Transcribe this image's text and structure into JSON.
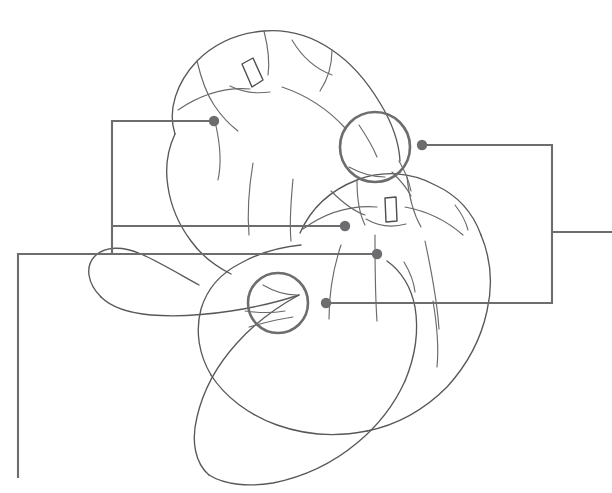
{
  "figure": {
    "background_color": "#ffffff",
    "ink_color": "#58585a",
    "callout_color": "#6d6d6f",
    "width": 612,
    "height": 493
  },
  "subjects": [
    {
      "id": "pumpkin-upper-left",
      "label": "Upper left pumpkin",
      "stalk": {
        "label": "Stalk",
        "x": 250,
        "y": 72,
        "angle": -28
      }
    },
    {
      "id": "pumpkin-lower-right",
      "label": "Lower right pumpkin",
      "stalk": {
        "label": "Stalk",
        "x": 390,
        "y": 209,
        "angle": 4
      }
    }
  ],
  "highlight_circles": [
    {
      "id": "highlight-circle-upper",
      "label": "Detail highlight upper",
      "cx": 375,
      "cy": 147,
      "r": 35
    },
    {
      "id": "highlight-circle-lower",
      "label": "Detail highlight lower",
      "cx": 278,
      "cy": 303,
      "r": 30
    }
  ],
  "callouts": [
    {
      "id": "callout-1",
      "label": "Callout 1 leader",
      "dot": {
        "x": 214,
        "y": 121
      },
      "path": "M 214 121 L 112 121 L 112 254"
    },
    {
      "id": "callout-2",
      "label": "Callout 2 leader",
      "dot": {
        "x": 345,
        "y": 226
      },
      "path": "M 345 226 L 112 226"
    },
    {
      "id": "callout-3",
      "label": "Callout 3 leader",
      "dot": {
        "x": 377,
        "y": 254
      },
      "path": "M 377 254 L 18 254 L 18 478"
    },
    {
      "id": "callout-4",
      "label": "Callout 4 leader",
      "dot": {
        "x": 422,
        "y": 145
      },
      "path": "M 422 145 L 552 145 L 552 232 L 612 232"
    },
    {
      "id": "callout-5",
      "label": "Callout 5 leader",
      "dot": {
        "x": 326,
        "y": 303
      },
      "path": "M 326 303 L 552 303 L 552 232"
    }
  ],
  "sketch_strokes": {
    "pumpkin_upper_outline": "M 175 132 C 168 110 176 82 196 62 C 214 44 238 34 262 32 C 288 30 312 38 330 50 C 352 64 366 82 378 102 C 390 120 398 140 398 160",
    "pumpkin_upper_outline_left": "M 175 132 C 168 148 166 166 168 184 C 170 204 178 222 190 238 C 200 252 214 264 230 272",
    "pumpkin_upper_rib_1": "M 196 62 C 200 78 204 92 212 104 C 220 116 228 124 236 130",
    "pumpkin_upper_rib_2": "M 262 32 C 266 48 268 62 266 74",
    "pumpkin_upper_rib_3": "M 290 40 C 300 56 314 68 330 74",
    "pumpkin_upper_rib_4": "M 330 50 C 330 64 326 78 318 90",
    "pumpkin_upper_crease_left": "M 176 108 C 198 94 222 86 248 88",
    "pumpkin_upper_crease_right": "M 280 86 C 304 94 326 108 344 128",
    "pumpkin_upper_inner_1": "M 214 124 C 218 142 220 160 216 178",
    "pumpkin_upper_inner_2": "M 252 162 C 248 186 246 210 248 234",
    "pumpkin_upper_inner_3": "M 292 178 C 290 200 288 220 290 240",
    "pumpkin_lower_outline_top": "M 300 232 C 310 208 330 190 356 180 C 382 170 410 172 434 184 C 456 194 472 212 480 234",
    "pumpkin_lower_outline_right": "M 480 234 C 490 258 492 284 486 310 C 480 338 466 364 446 386 C 424 408 396 424 366 430",
    "pumpkin_lower_outline_bottom": "M 366 430 C 336 436 304 434 276 424 C 248 414 224 396 210 374",
    "pumpkin_lower_outline_left": "M 210 374 C 198 354 194 330 200 308 C 206 288 220 272 240 262 C 258 252 280 246 300 244",
    "pumpkin_lower_rib_1": "M 356 180 C 356 198 358 212 364 224",
    "pumpkin_lower_rib_2": "M 406 176 C 408 196 412 212 420 226",
    "pumpkin_lower_crease_left": "M 302 228 C 324 212 350 204 376 206",
    "pumpkin_lower_crease_right": "M 404 206 C 426 210 446 220 462 234",
    "pumpkin_lower_inner_1": "M 374 234 C 374 262 374 292 376 320",
    "pumpkin_lower_inner_2": "M 424 240 C 430 268 436 298 438 328",
    "pumpkin_lower_inner_3": "M 340 244 C 332 268 328 294 328 318",
    "pumpkin_lower_inner_4": "M 432 300 C 436 324 438 346 436 366",
    "gourd_lobe_left": "M 100 296 C 86 282 84 266 94 256 C 104 246 122 246 140 254 C 158 262 178 274 198 284",
    "gourd_lobe_left_b": "M 100 296 C 110 306 128 312 150 314 C 176 316 204 314 230 310 C 256 306 280 300 298 294",
    "gourd_tail": "M 298 294 C 276 306 254 322 236 342 C 216 364 202 390 196 416 C 190 440 194 462 208 474",
    "gourd_tail_b": "M 208 474 C 224 484 248 486 272 482 C 302 476 332 462 356 442 C 378 424 394 402 404 380",
    "gourd_tail_c": "M 404 380 C 414 356 418 330 414 306 C 410 286 400 270 386 260",
    "pumpkin_lower_top_cap": "M 330 190 C 342 202 352 210 364 214",
    "detail_scratch_1": "M 358 124 C 366 136 372 146 376 156",
    "detail_scratch_2": "M 352 166 C 362 172 372 176 384 176",
    "detail_scratch_3": "M 398 160 C 404 170 408 180 410 190",
    "detail_scratch_4": "M 262 284 C 272 290 284 294 296 294",
    "detail_scratch_5": "M 244 310 C 258 312 272 312 284 310",
    "detail_scratch_6": "M 248 326 C 262 322 278 318 292 316"
  }
}
